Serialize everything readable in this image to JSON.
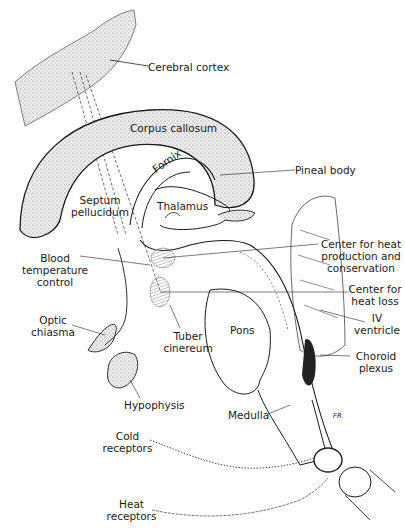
{
  "diagram": {
    "labels": {
      "cerebral_cortex": "Cerebral cortex",
      "corpus_callosum": "Corpus callosum",
      "fornix": "Fornix",
      "pineal_body": "Pineal body",
      "septum_1": "Septum",
      "septum_2": "pellucidum",
      "thalamus": "Thalamus",
      "heat_prod_1": "Center for heat",
      "heat_prod_2": "production and",
      "heat_prod_3": "conservation",
      "blood_temp_1": "Blood",
      "blood_temp_2": "temperature",
      "blood_temp_3": "control",
      "heat_loss_1": "Center for",
      "heat_loss_2": "heat loss",
      "iv_1": "IV",
      "iv_2": "ventricle",
      "optic_1": "Optic",
      "optic_2": "chiasma",
      "tuber_1": "Tuber",
      "tuber_2": "cinereum",
      "pons": "Pons",
      "choroid_1": "Choroid",
      "choroid_2": "plexus",
      "hypophysis": "Hypophysis",
      "medulla": "Medulla",
      "cold_1": "Cold",
      "cold_2": "receptors",
      "heat_1": "Heat",
      "heat_2": "receptors",
      "signature": "FR"
    },
    "colors": {
      "ink": "#1a1a1a",
      "stipple": "#cfcfcf",
      "background": "#ffffff"
    }
  }
}
